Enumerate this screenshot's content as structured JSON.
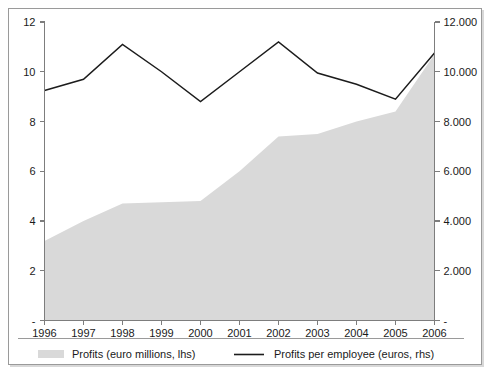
{
  "figure": {
    "background_color": "#ffffff",
    "frame_color": "#9a9a9a",
    "area_color": "#d9d9d9",
    "line_color": "#1c1c1c"
  },
  "legend": {
    "position": "bottom",
    "items": [
      {
        "label": "Profits (euro millions, lhs)",
        "marker": "area-swatch",
        "color": "#d9d9d9"
      },
      {
        "label": "Profits per employee (euros, rhs)",
        "marker": "line-swatch",
        "color": "#1c1c1c"
      }
    ]
  },
  "axes": {
    "x_tick_labels": [
      "1996",
      "1997",
      "1998",
      "1999",
      "2000",
      "2001",
      "2002",
      "2003",
      "2004",
      "2005",
      "2006"
    ],
    "left_tick_labels": [
      "-",
      "2",
      "4",
      "6",
      "8",
      "10",
      "12"
    ],
    "right_tick_labels": [
      "-",
      "2.000",
      "4.000",
      "6.000",
      "8.000",
      "10.000",
      "12.000"
    ]
  },
  "chart_data": {
    "type": "area",
    "title": "",
    "subtitle": "",
    "xlabel": "",
    "ylabel": "",
    "grid": false,
    "legend_position": "bottom",
    "categories": [
      "1996",
      "1997",
      "1998",
      "1999",
      "2000",
      "2001",
      "2002",
      "2003",
      "2004",
      "2005",
      "2006"
    ],
    "x": [
      1996,
      1997,
      1998,
      1999,
      2000,
      2001,
      2002,
      2003,
      2004,
      2005,
      2006
    ],
    "series": [
      {
        "name": "Profits (euro millions, lhs)",
        "type": "area",
        "axis": "left",
        "color": "#d9d9d9",
        "unit": "euro millions",
        "values": [
          3.2,
          4.0,
          4.7,
          4.75,
          4.8,
          6.0,
          7.4,
          7.5,
          8.0,
          8.4,
          10.7
        ]
      },
      {
        "name": "Profits per employee (euros, rhs)",
        "type": "line",
        "axis": "right",
        "color": "#1c1c1c",
        "unit": "euros",
        "values": [
          9250,
          9700,
          11100,
          10000,
          8800,
          10000,
          11200,
          9950,
          9500,
          8900,
          10750
        ]
      }
    ],
    "left_axis": {
      "label": "",
      "ylim": [
        0,
        12
      ],
      "ticks": [
        0,
        2,
        4,
        6,
        8,
        10,
        12
      ],
      "tick_labels": [
        "-",
        "2",
        "4",
        "6",
        "8",
        "10",
        "12"
      ]
    },
    "right_axis": {
      "label": "",
      "ylim": [
        0,
        12000
      ],
      "ticks": [
        0,
        2000,
        4000,
        6000,
        8000,
        10000,
        12000
      ],
      "tick_labels": [
        "-",
        "2.000",
        "4.000",
        "6.000",
        "8.000",
        "10.000",
        "12.000"
      ]
    },
    "xlim": [
      1996,
      2006
    ]
  }
}
